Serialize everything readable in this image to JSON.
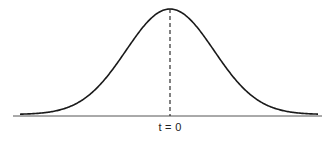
{
  "diagram": {
    "type": "gaussian-bell-curve",
    "center_label": "t = 0",
    "colors": {
      "curve": "#1a1a1a",
      "axis": "#444444",
      "dashed": "#1a1a1a"
    }
  },
  "chart_data": {
    "type": "line",
    "title": "",
    "xlabel": "",
    "ylabel": "",
    "annotations": [
      "t = 0"
    ],
    "x": [
      -4,
      -3,
      -2,
      -1.5,
      -1,
      -0.5,
      0,
      0.5,
      1,
      1.5,
      2,
      3,
      4
    ],
    "series": [
      {
        "name": "bell curve",
        "values": [
          0.0003,
          0.011,
          0.135,
          0.325,
          0.607,
          0.882,
          1.0,
          0.882,
          0.607,
          0.325,
          0.135,
          0.011,
          0.0003
        ]
      }
    ],
    "grid": false,
    "legend": "none"
  }
}
